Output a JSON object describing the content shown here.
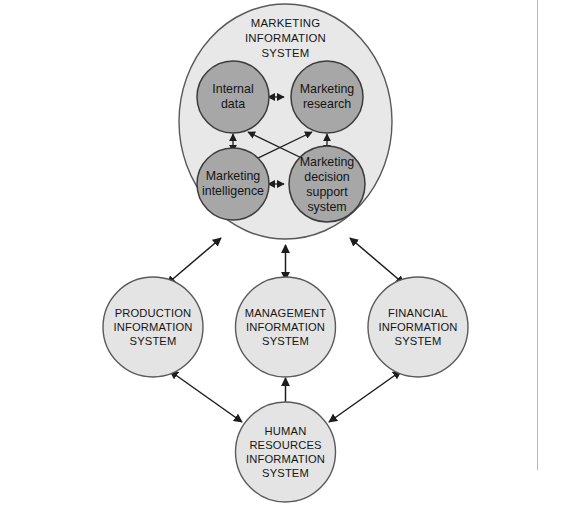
{
  "diagram": {
    "colors": {
      "mis_container_fill": "#e8e8e8",
      "mis_container_stroke": "#58585a",
      "inner_circle_fill": "#a7a7a7",
      "inner_circle_stroke": "#3b3b3b",
      "outer_circle_fill": "#e4e4e4",
      "outer_circle_stroke": "#5a5a5c",
      "arrow_color": "#1d1d1d",
      "text_color": "#151515",
      "background": "#ffffff"
    },
    "mis": {
      "title_lines": [
        "MARKETING",
        "INFORMATION",
        "SYSTEM"
      ],
      "title_line_1": "MARKETING",
      "title_line_2": "INFORMATION",
      "title_line_3": "SYSTEM",
      "components": [
        {
          "id": "internal-data",
          "lines": [
            "Internal",
            "data"
          ],
          "line_1": "Internal",
          "line_2": "data"
        },
        {
          "id": "marketing-research",
          "lines": [
            "Marketing",
            "research"
          ],
          "line_1": "Marketing",
          "line_2": "research"
        },
        {
          "id": "marketing-intelligence",
          "lines": [
            "Marketing",
            "intelligence"
          ],
          "line_1": "Marketing",
          "line_2": "intelligence"
        },
        {
          "id": "marketing-decision-support-system",
          "lines": [
            "Marketing",
            "decision",
            "support",
            "system"
          ],
          "line_1": "Marketing",
          "line_2": "decision",
          "line_3": "support",
          "line_4": "system"
        }
      ]
    },
    "systems": [
      {
        "id": "production-information-system",
        "lines": [
          "PRODUCTION",
          "INFORMATION",
          "SYSTEM"
        ],
        "line_1": "PRODUCTION",
        "line_2": "INFORMATION",
        "line_3": "SYSTEM"
      },
      {
        "id": "management-information-system",
        "lines": [
          "MANAGEMENT",
          "INFORMATION",
          "SYSTEM"
        ],
        "line_1": "MANAGEMENT",
        "line_2": "INFORMATION",
        "line_3": "SYSTEM"
      },
      {
        "id": "financial-information-system",
        "lines": [
          "FINANCIAL",
          "INFORMATION",
          "SYSTEM"
        ],
        "line_1": "FINANCIAL",
        "line_2": "INFORMATION",
        "line_3": "SYSTEM"
      },
      {
        "id": "human-resources-information-system",
        "lines": [
          "HUMAN",
          "RESOURCES",
          "INFORMATION",
          "SYSTEM"
        ],
        "line_1": "HUMAN",
        "line_2": "RESOURCES",
        "line_3": "INFORMATION",
        "line_4": "SYSTEM"
      }
    ],
    "connections": [
      {
        "from": "internal-data",
        "to": "marketing-research",
        "type": "bidirectional"
      },
      {
        "from": "internal-data",
        "to": "marketing-intelligence",
        "type": "bidirectional"
      },
      {
        "from": "marketing-research",
        "to": "marketing-decision-support-system",
        "type": "bidirectional"
      },
      {
        "from": "marketing-intelligence",
        "to": "marketing-decision-support-system",
        "type": "bidirectional"
      },
      {
        "from": "internal-data",
        "to": "marketing-decision-support-system",
        "type": "bidirectional"
      },
      {
        "from": "marketing-research",
        "to": "marketing-intelligence",
        "type": "bidirectional"
      },
      {
        "from": "marketing-information-system",
        "to": "production-information-system",
        "type": "bidirectional"
      },
      {
        "from": "marketing-information-system",
        "to": "management-information-system",
        "type": "bidirectional"
      },
      {
        "from": "marketing-information-system",
        "to": "financial-information-system",
        "type": "bidirectional"
      },
      {
        "from": "production-information-system",
        "to": "human-resources-information-system",
        "type": "bidirectional"
      },
      {
        "from": "management-information-system",
        "to": "human-resources-information-system",
        "type": "bidirectional"
      },
      {
        "from": "financial-information-system",
        "to": "human-resources-information-system",
        "type": "bidirectional"
      }
    ]
  }
}
